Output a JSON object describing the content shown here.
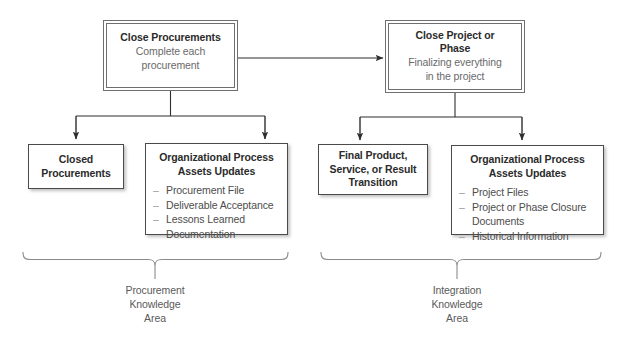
{
  "diagram": {
    "colors": {
      "background": "#ffffff",
      "box_border": "#4a4a4a",
      "process_border": "#6f6f6f",
      "title_text": "#2b2b2b",
      "body_text": "#4d4d4d",
      "subtitle_text": "#6a6a6a",
      "connector": "#3a3a3a",
      "brace": "#8a8a8a"
    },
    "processes": [
      {
        "id": "close-procurements",
        "title": "Close Procurements",
        "subtitle_line1": "Complete each",
        "subtitle_line2": "procurement"
      },
      {
        "id": "close-project-or-phase",
        "title_line1": "Close Project or",
        "title_line2": "Phase",
        "subtitle_line1": "Finalizing everything",
        "subtitle_line2": "in the project"
      }
    ],
    "outputs": {
      "closed_procurements": {
        "title_line1": "Closed",
        "title_line2": "Procurements"
      },
      "opa_left": {
        "head_line1": "Organizational Process",
        "head_line2": "Assets Updates",
        "items": [
          {
            "text": "Procurement File",
            "continuation": ""
          },
          {
            "text": "Deliverable Acceptance",
            "continuation": ""
          },
          {
            "text": "Lessons Learned",
            "continuation": "Documentation"
          }
        ]
      },
      "final_product": {
        "title_line1": "Final Product,",
        "title_line2": "Service, or Result",
        "title_line3": "Transition"
      },
      "opa_right": {
        "head_line1": "Organizational Process",
        "head_line2": "Assets Updates",
        "items": [
          {
            "text": "Project Files",
            "continuation": ""
          },
          {
            "text": "Project or Phase Closure",
            "continuation": "Documents"
          },
          {
            "text": "Historical Information",
            "continuation": ""
          }
        ]
      }
    },
    "braces": [
      {
        "id": "procurement-knowledge-area",
        "label_line1": "Procurement",
        "label_line2": "Knowledge",
        "label_line3": "Area"
      },
      {
        "id": "integration-knowledge-area",
        "label_line1": "Integration",
        "label_line2": "Knowledge",
        "label_line3": "Area"
      }
    ],
    "connectors": {
      "cross_arrow_label": "close-procurements-to-close-project-arrow",
      "left_branch_label": "close-procurements-outputs-branch",
      "right_branch_label": "close-project-outputs-branch"
    }
  }
}
